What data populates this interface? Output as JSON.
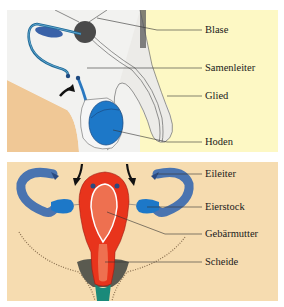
{
  "male_diagram": {
    "labels": [
      {
        "id": "blase",
        "text": "Blase"
      },
      {
        "id": "samenleiter",
        "text": "Samenleiter"
      },
      {
        "id": "glied",
        "text": "Glied"
      },
      {
        "id": "hoden",
        "text": "Hoden"
      }
    ]
  },
  "female_diagram": {
    "labels": [
      {
        "id": "eileiter",
        "text": "Eileiter"
      },
      {
        "id": "eierstock",
        "text": "Eierstock"
      },
      {
        "id": "gebaermutter",
        "text": "Gebärmutter"
      },
      {
        "id": "scheide",
        "text": "Scheide"
      }
    ]
  },
  "colors": {
    "male_bg_left": "#f2f2f0",
    "male_bg_right": "#fdf8c4",
    "skin": "#f0c896",
    "female_bg": "#f6dcb0",
    "organ_blue": "#1d78c8",
    "tube_blue": "#4a74b0",
    "uterus_red": "#e8341c",
    "uterus_inner": "#ee7050",
    "vagina_teal": "#1a8a7a"
  }
}
